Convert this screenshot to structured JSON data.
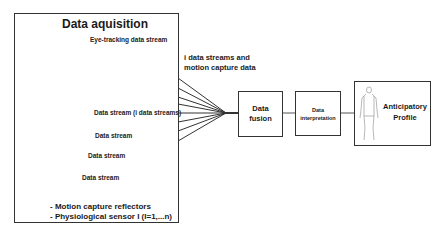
{
  "acquisition": {
    "title": "Data aquisition",
    "labels": [
      {
        "id": "eye",
        "text": "Eye-tracking data stream"
      },
      {
        "id": "arm",
        "text": "Data stream (i data streams)"
      },
      {
        "id": "thigh",
        "text": "Data stream"
      },
      {
        "id": "shin",
        "text": "Data stream"
      },
      {
        "id": "foot",
        "text": "Data stream"
      }
    ],
    "legend": [
      {
        "symbol": "square",
        "text": "- Motion capture reflectors"
      },
      {
        "symbol": "dot",
        "text": "- Physiological sensor I (I=1,...n)"
      }
    ]
  },
  "streams_label": {
    "line1": "i data streams and",
    "line2": "motion capture data"
  },
  "fusion": {
    "line1": "Data",
    "line2": "fusion"
  },
  "interpretation": {
    "line1": "Data",
    "line2": "interpretation"
  },
  "profile": {
    "line1": "Anticipatory",
    "line2": "Profile"
  },
  "colors": {
    "stroke": "#333333",
    "marker": "#3a3a3a",
    "background": "#ffffff"
  }
}
